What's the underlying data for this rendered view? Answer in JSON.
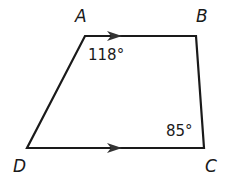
{
  "figure": {
    "type": "trapezoid",
    "vertices": {
      "A": {
        "label": "A",
        "x": 85,
        "y": 36
      },
      "B": {
        "label": "B",
        "x": 196,
        "y": 36
      },
      "C": {
        "label": "C",
        "x": 204,
        "y": 148
      },
      "D": {
        "label": "D",
        "x": 27,
        "y": 148
      }
    },
    "angles": {
      "A": {
        "text": "118°"
      },
      "C": {
        "text": "85°"
      }
    },
    "parallel_sides": [
      "AB",
      "DC"
    ],
    "colors": {
      "stroke": "#1a1a1a",
      "background": "#ffffff"
    }
  }
}
